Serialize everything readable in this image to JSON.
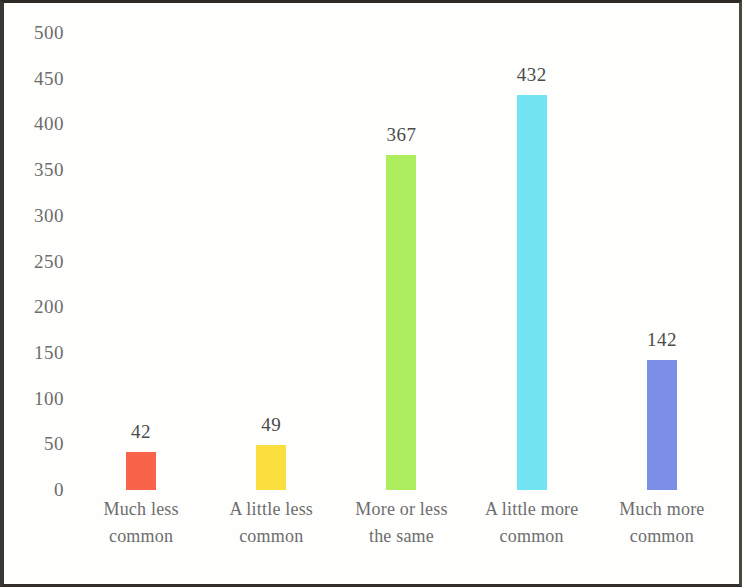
{
  "chart_data": {
    "type": "bar",
    "title": "",
    "subtitle": "",
    "xlabel": "",
    "ylabel": "",
    "ylim": [
      0,
      500
    ],
    "ytick_step": 50,
    "yticks": [
      "0",
      "50",
      "100",
      "150",
      "200",
      "250",
      "300",
      "350",
      "400",
      "450",
      "500"
    ],
    "grid": false,
    "legend": "none",
    "categories": [
      "Much less common",
      "A little less common",
      "More or less the same",
      "A little more common",
      "Much more common"
    ],
    "category_lines": [
      [
        "Much less",
        "common"
      ],
      [
        "A little less",
        "common"
      ],
      [
        "More or less",
        "the same"
      ],
      [
        "A little more",
        "common"
      ],
      [
        "Much more",
        "common"
      ]
    ],
    "values": [
      42,
      49,
      367,
      432,
      142
    ],
    "value_labels": [
      "42",
      "49",
      "367",
      "432",
      "142"
    ],
    "colors": [
      "#F9634A",
      "#FBDF3F",
      "#AEEE5E",
      "#73E4F2",
      "#7B8FE8"
    ],
    "bars": [
      {
        "category": "Much less common",
        "value": 42,
        "label": "42",
        "color": "#F9634A"
      },
      {
        "category": "A little less common",
        "value": 49,
        "label": "49",
        "color": "#FBDF3F"
      },
      {
        "category": "More or less the same",
        "value": 367,
        "label": "367",
        "color": "#AEEE5E"
      },
      {
        "category": "A little more common",
        "value": 432,
        "label": "432",
        "color": "#73E4F2"
      },
      {
        "category": "Much more common",
        "value": 142,
        "label": "142",
        "color": "#7B8FE8"
      }
    ],
    "axis_text_color": "#6d6d6d",
    "value_text_color": "#4b4b4b",
    "background_color": "#fefefd",
    "frame_color": "#32302c"
  }
}
